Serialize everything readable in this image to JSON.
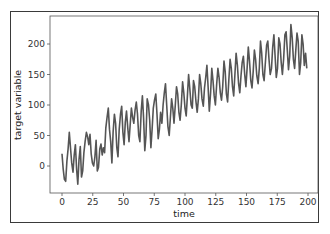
{
  "chart_data": {
    "type": "line",
    "title": "",
    "xlabel": "time",
    "ylabel": "target variable",
    "xlim": [
      -10,
      210
    ],
    "ylim": [
      -50,
      245
    ],
    "xticks": [
      0,
      25,
      50,
      75,
      100,
      125,
      150,
      175,
      200
    ],
    "yticks": [
      0,
      50,
      100,
      150,
      200
    ],
    "grid": false,
    "legend": null,
    "line_color": "#555555",
    "series": [
      {
        "name": "target variable",
        "x_start": 0,
        "x_end": 199,
        "values": [
          20,
          -5,
          -22,
          -25,
          8,
          28,
          55,
          30,
          5,
          -10,
          18,
          35,
          -5,
          -30,
          10,
          32,
          -18,
          -8,
          22,
          40,
          55,
          48,
          35,
          52,
          20,
          5,
          0,
          15,
          42,
          -8,
          -2,
          28,
          36,
          18,
          30,
          22,
          62,
          80,
          95,
          60,
          40,
          5,
          55,
          85,
          70,
          30,
          15,
          60,
          85,
          98,
          55,
          35,
          72,
          90,
          62,
          40,
          68,
          95,
          80,
          70,
          92,
          105,
          85,
          50,
          40,
          90,
          115,
          78,
          25,
          50,
          110,
          100,
          75,
          30,
          60,
          95,
          108,
          118,
          85,
          45,
          60,
          88,
          70,
          100,
          120,
          135,
          100,
          65,
          50,
          80,
          110,
          95,
          70,
          100,
          130,
          118,
          88,
          75,
          100,
          138,
          120,
          95,
          82,
          115,
          150,
          125,
          100,
          95,
          140,
          130,
          105,
          88,
          110,
          150,
          135,
          110,
          98,
          128,
          145,
          165,
          130,
          90,
          120,
          160,
          140,
          115,
          100,
          135,
          160,
          145,
          120,
          108,
          130,
          172,
          155,
          118,
          105,
          140,
          175,
          160,
          130,
          115,
          150,
          185,
          165,
          135,
          120,
          148,
          170,
          180,
          150,
          130,
          160,
          195,
          172,
          140,
          128,
          155,
          190,
          175,
          148,
          135,
          160,
          205,
          185,
          150,
          140,
          170,
          198,
          205,
          175,
          150,
          160,
          195,
          215,
          180,
          145,
          160,
          210,
          200,
          170,
          150,
          175,
          215,
          220,
          190,
          158,
          180,
          232,
          210,
          175,
          160,
          190,
          218,
          205,
          150,
          170,
          215,
          200,
          165,
          185,
          160
        ],
        "trend": "increasing linearly from ~0 to ~190 with oscillations of roughly ±35"
      }
    ]
  },
  "axes": {
    "x_tick_labels": [
      "0",
      "25",
      "50",
      "75",
      "100",
      "125",
      "150",
      "175",
      "200"
    ],
    "y_tick_labels": [
      "0",
      "50",
      "100",
      "150",
      "200"
    ],
    "xlabel": "time",
    "ylabel": "target variable"
  }
}
